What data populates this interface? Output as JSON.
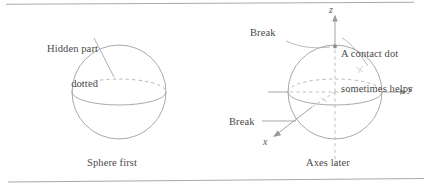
{
  "figure": {
    "background_color": "#ffffff",
    "ink_color": "#8d8d8d",
    "text_color": "#4a4a4a",
    "rule_color": "#a9a9a9",
    "width": 432,
    "height": 186
  },
  "panels": {
    "left": {
      "caption": "Sphere first",
      "annotation": "Hidden part\ndotted",
      "annotation_line1": "Hidden part",
      "annotation_line2": "dotted"
    },
    "right": {
      "caption": "Axes later",
      "annotations": {
        "break_top": "Break",
        "break_bottom": "Break",
        "contact_dot": "A contact dot\nsometimes helps",
        "contact_dot_line1": "A contact dot",
        "contact_dot_line2": "sometimes helps"
      },
      "axes": {
        "z": "z",
        "y": "y",
        "x": "x"
      }
    }
  }
}
